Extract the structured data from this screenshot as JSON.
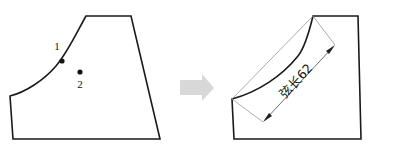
{
  "diagram": {
    "background_color": "#ffffff",
    "outline_color": "#1a1a1a",
    "arrow_color": "#d8d8d8",
    "dimension_color": "#5b5b5b",
    "left_shape": {
      "name": "original-profile",
      "points": [
        {
          "id": "point-1",
          "label": "1",
          "x": 62,
          "y": 61,
          "label_x": 57,
          "label_y": 50
        },
        {
          "id": "point-2",
          "label": "2",
          "x": 80,
          "y": 72,
          "label_x": 78,
          "label_y": 88
        }
      ]
    },
    "transform_arrow": {
      "name": "transform-arrow",
      "direction": "right"
    },
    "right_shape": {
      "name": "modified-profile",
      "dimension": {
        "name": "chord-length-dimension",
        "text": "弦长62",
        "value": "62",
        "prefix": "弦长",
        "start_x": 263,
        "start_y": 122,
        "end_x": 335,
        "end_y": 45
      }
    }
  }
}
